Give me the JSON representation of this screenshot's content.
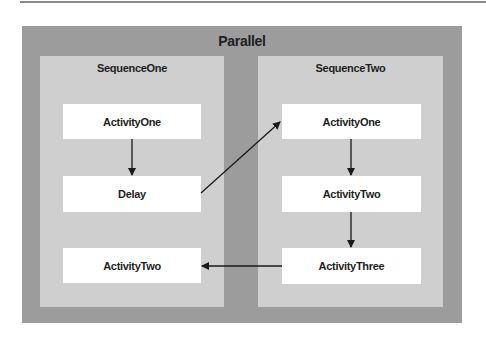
{
  "diagram": {
    "container": {
      "label": "Parallel"
    },
    "sequences": [
      {
        "label": "SequenceOne",
        "activities": [
          {
            "label": "ActivityOne"
          },
          {
            "label": "Delay"
          },
          {
            "label": "ActivityTwo"
          }
        ]
      },
      {
        "label": "SequenceTwo",
        "activities": [
          {
            "label": "ActivityOne"
          },
          {
            "label": "ActivityTwo"
          },
          {
            "label": "ActivityThree"
          }
        ]
      }
    ],
    "edges": [
      {
        "from": "SequenceOne.ActivityOne",
        "to": "SequenceOne.Delay"
      },
      {
        "from": "SequenceOne.Delay",
        "to": "SequenceTwo.ActivityOne"
      },
      {
        "from": "SequenceTwo.ActivityOne",
        "to": "SequenceTwo.ActivityTwo"
      },
      {
        "from": "SequenceTwo.ActivityTwo",
        "to": "SequenceTwo.ActivityThree"
      },
      {
        "from": "SequenceTwo.ActivityThree",
        "to": "SequenceOne.ActivityTwo"
      }
    ],
    "colors": {
      "outer": "#9c9c9c",
      "sequence": "#cfcfcf",
      "activity": "#ffffff",
      "text": "#1e1e1e"
    }
  }
}
